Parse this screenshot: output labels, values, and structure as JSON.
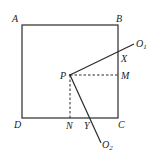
{
  "diagram": {
    "type": "geometry",
    "colors": {
      "stroke": "#2a2a2a",
      "label": "#222222",
      "background": "#ffffff"
    },
    "points": {
      "A": {
        "label": "A",
        "x": 22,
        "y": 25
      },
      "B": {
        "label": "B",
        "x": 118,
        "y": 25
      },
      "C": {
        "label": "C",
        "x": 118,
        "y": 118
      },
      "D": {
        "label": "D",
        "x": 22,
        "y": 118
      },
      "P": {
        "label": "P",
        "x": 70,
        "y": 75
      },
      "M": {
        "label": "M",
        "x": 118,
        "y": 75
      },
      "N": {
        "label": "N",
        "x": 70,
        "y": 118
      },
      "X": {
        "label": "X",
        "x": 118,
        "y": 51
      },
      "Y": {
        "label": "Y",
        "x": 93,
        "y": 118
      },
      "O1": {
        "label": "O",
        "sub": "1",
        "x": 134,
        "y": 44
      },
      "O2": {
        "label": "O",
        "sub": "2",
        "x": 101,
        "y": 143
      }
    },
    "segments": [
      {
        "from": "A",
        "to": "B",
        "style": "solid"
      },
      {
        "from": "B",
        "to": "C",
        "style": "solid"
      },
      {
        "from": "C",
        "to": "D",
        "style": "solid"
      },
      {
        "from": "D",
        "to": "A",
        "style": "solid"
      },
      {
        "from": "P",
        "to": "O1",
        "style": "solid"
      },
      {
        "from": "P",
        "to": "O2",
        "style": "solid"
      },
      {
        "from": "P",
        "to": "M",
        "style": "dashed"
      },
      {
        "from": "P",
        "to": "N",
        "style": "dashed"
      }
    ],
    "labels": {
      "A": "A",
      "B": "B",
      "C": "C",
      "D": "D",
      "P": "P",
      "M": "M",
      "N": "N",
      "X": "X",
      "Y": "Y",
      "O1_main": "O",
      "O1_sub": "1",
      "O2_main": "O",
      "O2_sub": "2"
    }
  }
}
